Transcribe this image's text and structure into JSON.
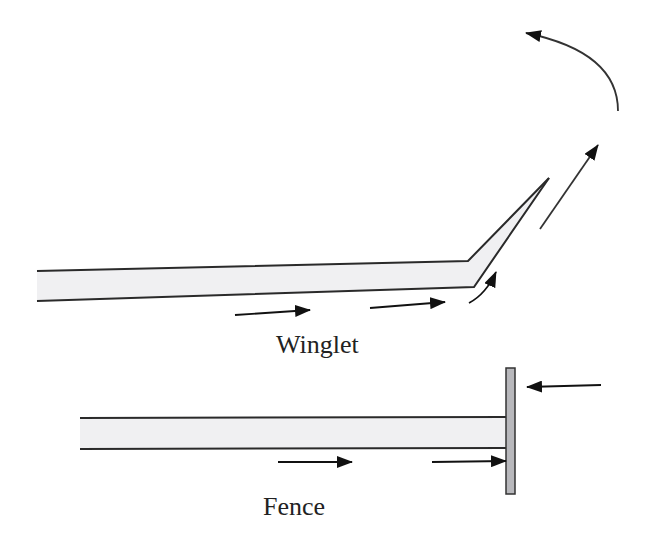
{
  "diagram": {
    "type": "flow-schematic",
    "colors": {
      "background": "#ffffff",
      "wing_fill": "#f0f0f2",
      "outline": "#2a2a2a",
      "fence_plate": "#b8b8bc",
      "arrow": "#111111"
    }
  },
  "winglet": {
    "label": "Winglet",
    "arrows": [
      "flow-under-wing-1",
      "flow-under-wing-2",
      "flow-curving-up",
      "flow-up-along-winglet",
      "vortex-curl"
    ]
  },
  "fence": {
    "label": "Fence",
    "arrows": [
      "flow-under-wing",
      "flow-into-fence",
      "flow-from-right-toward-fence"
    ]
  }
}
